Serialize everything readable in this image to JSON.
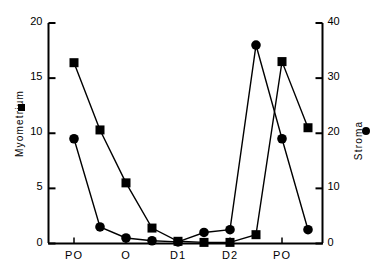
{
  "chart_data": {
    "type": "line",
    "title": "",
    "xlabel": "",
    "x_tick_labels": [
      "PO",
      "O",
      "D1",
      "D2",
      "PO"
    ],
    "x_tick_positions": [
      0,
      2,
      4,
      6,
      8
    ],
    "x_points": [
      0,
      1,
      2,
      3,
      4,
      5,
      6,
      7,
      8,
      9
    ],
    "grid": false,
    "legend_position": "axis-labels",
    "series": [
      {
        "name": "Myometrium",
        "marker": "square",
        "color": "#000000",
        "axis": "left",
        "ylabel": "Myometrium",
        "ylim": [
          0,
          20
        ],
        "yticks": [
          0,
          5,
          10,
          15,
          20
        ],
        "values": [
          16.4,
          10.3,
          5.5,
          1.4,
          0.2,
          0.1,
          0.1,
          0.8,
          16.5,
          10.5
        ]
      },
      {
        "name": "Stroma",
        "marker": "circle",
        "color": "#000000",
        "axis": "right",
        "ylabel": "Stroma",
        "ylim": [
          0,
          40
        ],
        "yticks": [
          0,
          10,
          20,
          30,
          40
        ],
        "values": [
          19.0,
          3.0,
          1.0,
          0.5,
          0.3,
          2.0,
          2.5,
          36.0,
          19.0,
          2.5
        ]
      }
    ]
  },
  "axes": {
    "left": {
      "title": "Myometrium",
      "tick_labels": [
        "20",
        "15",
        "10",
        "5",
        "0"
      ],
      "legend_marker": "filled-square"
    },
    "right": {
      "title": "Stroma",
      "tick_labels": [
        "40",
        "30",
        "20",
        "10",
        "0"
      ],
      "legend_marker": "filled-circle"
    },
    "bottom": {
      "tick_labels": [
        "PO",
        "O",
        "D1",
        "D2",
        "PO"
      ]
    }
  }
}
